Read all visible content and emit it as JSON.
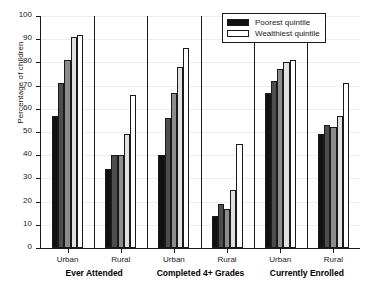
{
  "chart_data": {
    "type": "bar",
    "title": "",
    "subtitle": "",
    "xlabel": "",
    "ylabel": "Percentage of children",
    "ylim": [
      0,
      100
    ],
    "ytick_step": 10,
    "yticks": [
      0,
      10,
      20,
      30,
      40,
      50,
      60,
      70,
      80,
      90,
      100
    ],
    "grid": true,
    "legend_position": "top-right",
    "legend": [
      {
        "label": "Poorest quintile",
        "color": "#111111"
      },
      {
        "label": "Wealthiest quintile",
        "color": "#ffffff"
      }
    ],
    "series": [
      {
        "name": "Poorest quintile",
        "color": "#111111",
        "values": [
          57,
          34,
          40,
          14,
          67,
          49
        ]
      },
      {
        "name": "Second quintile",
        "color": "#4d4d4d",
        "values": [
          71,
          40,
          56,
          19,
          72,
          53
        ]
      },
      {
        "name": "Middle quintile",
        "color": "#8c8c8c",
        "values": [
          81,
          40,
          67,
          17,
          77,
          52
        ]
      },
      {
        "name": "Fourth quintile",
        "color": "#e0e0e0",
        "values": [
          91,
          49,
          78,
          25,
          80,
          57
        ]
      },
      {
        "name": "Wealthiest quintile",
        "color": "#ffffff",
        "values": [
          92,
          66,
          86,
          45,
          81,
          71
        ]
      }
    ],
    "categories": [
      {
        "sub": "Urban",
        "group": "Ever Attended"
      },
      {
        "sub": "Rural",
        "group": "Ever Attended"
      },
      {
        "sub": "Urban",
        "group": "Completed 4+ Grades"
      },
      {
        "sub": "Rural",
        "group": "Completed 4+ Grades"
      },
      {
        "sub": "Urban",
        "group": "Currently Enrolled"
      },
      {
        "sub": "Rural",
        "group": "Currently Enrolled"
      }
    ],
    "groups": [
      {
        "label": "Ever Attended",
        "categories": [
          "Urban",
          "Rural"
        ]
      },
      {
        "label": "Completed 4+ Grades",
        "categories": [
          "Urban",
          "Rural"
        ]
      },
      {
        "label": "Currently Enrolled",
        "categories": [
          "Urban",
          "Rural"
        ]
      }
    ],
    "axis_color": "#1a1a1a",
    "grid_color": "#eeeeee",
    "background": "#ffffff"
  }
}
